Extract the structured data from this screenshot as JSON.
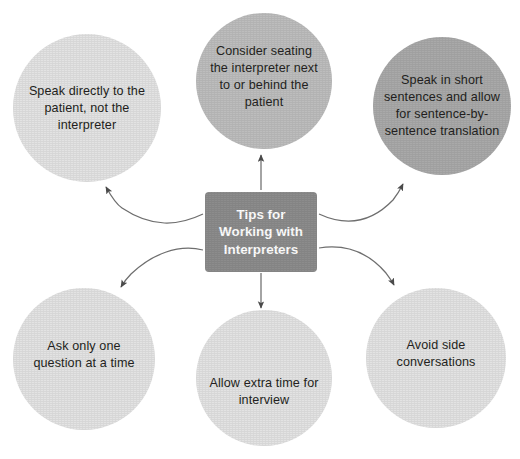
{
  "diagram": {
    "title": "Tips for Working with Interpreters",
    "center": {
      "label": "Tips for Working with Interpreters",
      "lines": [
        "Tips for",
        "Working with",
        "Interpreters"
      ],
      "fill_color": "#8c8c8c",
      "text_color": "#ffffff"
    },
    "nodes": [
      {
        "id": "speak-directly",
        "label": "Speak directly to the patient, not the interpreter",
        "position": "top-left",
        "fill_color": "#e3e3e3",
        "text_color": "#231f20"
      },
      {
        "id": "consider-seating",
        "label": "Consider seating the interpreter next to or behind the patient",
        "position": "top-center",
        "fill_color": "#bdbdbd",
        "text_color": "#231f20"
      },
      {
        "id": "short-sentences",
        "label": "Speak in short sentences and allow for sentence-by-sentence translation",
        "position": "top-right",
        "fill_color": "#a9a9a9",
        "text_color": "#231f20"
      },
      {
        "id": "one-question",
        "label": "Ask only one question at a time",
        "position": "bottom-left",
        "fill_color": "#e3e3e3",
        "text_color": "#231f20"
      },
      {
        "id": "extra-time",
        "label": "Allow extra time for interview",
        "position": "bottom-center",
        "fill_color": "#e3e3e3",
        "text_color": "#231f20"
      },
      {
        "id": "avoid-side-conversations",
        "label": "Avoid side conversations",
        "position": "bottom-right",
        "fill_color": "#e3e3e3",
        "text_color": "#231f20"
      }
    ],
    "connectors": [
      {
        "from": "center",
        "to": "speak-directly",
        "style": "curved-arrow"
      },
      {
        "from": "center",
        "to": "consider-seating",
        "style": "straight-arrow"
      },
      {
        "from": "center",
        "to": "short-sentences",
        "style": "curved-arrow"
      },
      {
        "from": "center",
        "to": "one-question",
        "style": "curved-arrow"
      },
      {
        "from": "center",
        "to": "extra-time",
        "style": "straight-arrow"
      },
      {
        "from": "center",
        "to": "avoid-side-conversations",
        "style": "curved-arrow"
      }
    ],
    "connector_color": "#6e6e6e",
    "background_color": "#ffffff"
  }
}
